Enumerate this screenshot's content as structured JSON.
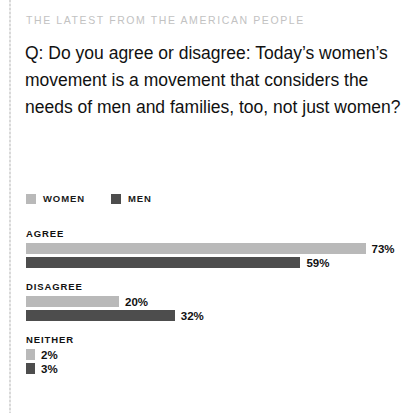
{
  "kicker": "THE LATEST FROM THE AMERICAN PEOPLE",
  "question": "Q: Do you agree or disagree: Today’s women’s movement is a movement that considers the needs of men and families, too, not just women?",
  "colors": {
    "women": "#b9b9b9",
    "men": "#4d4d4d",
    "kicker": "#c2c2c2",
    "text": "#111111",
    "background": "#ffffff"
  },
  "legend": [
    {
      "label": "WOMEN",
      "color": "#b9b9b9"
    },
    {
      "label": "MEN",
      "color": "#4d4d4d"
    }
  ],
  "groups": [
    {
      "label": "AGREE",
      "bars": [
        {
          "series": "WOMEN",
          "value": 73,
          "value_label": "73%",
          "color": "#b9b9b9"
        },
        {
          "series": "MEN",
          "value": 59,
          "value_label": "59%",
          "color": "#4d4d4d"
        }
      ]
    },
    {
      "label": "DISAGREE",
      "bars": [
        {
          "series": "WOMEN",
          "value": 20,
          "value_label": "20%",
          "color": "#b9b9b9"
        },
        {
          "series": "MEN",
          "value": 32,
          "value_label": "32%",
          "color": "#4d4d4d"
        }
      ]
    },
    {
      "label": "NEITHER",
      "bars": [
        {
          "series": "WOMEN",
          "value": 2,
          "value_label": "2%",
          "color": "#b9b9b9"
        },
        {
          "series": "MEN",
          "value": 3,
          "value_label": "3%",
          "color": "#4d4d4d"
        }
      ]
    }
  ],
  "chart_data": {
    "type": "bar",
    "title": "Q: Do you agree or disagree: Today’s women’s movement is a movement that considers the needs of men and families, too, not just women?",
    "subtitle": "THE LATEST FROM THE AMERICAN PEOPLE",
    "orientation": "horizontal",
    "categories": [
      "AGREE",
      "DISAGREE",
      "NEITHER"
    ],
    "series": [
      {
        "name": "WOMEN",
        "values": [
          73,
          20,
          2
        ],
        "color": "#b9b9b9"
      },
      {
        "name": "MEN",
        "values": [
          59,
          32,
          3
        ],
        "color": "#4d4d4d"
      }
    ],
    "value_labels": [
      [
        "73%",
        "20%",
        "2%"
      ],
      [
        "59%",
        "32%",
        "3%"
      ]
    ],
    "unit": "%",
    "xlabel": "",
    "ylabel": "",
    "xlim": [
      0,
      100
    ],
    "grid": false,
    "legend_position": "top-left"
  },
  "layout": {
    "bar_pixels_per_percent": 4.65,
    "bar_track_left_px": 26,
    "bar_height_px": 11
  }
}
